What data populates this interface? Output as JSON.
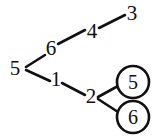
{
  "diagram": {
    "type": "tree-graph",
    "background_color": "#ffffff",
    "stroke_color": "#101010",
    "nodes": [
      {
        "id": "n5",
        "label": "5",
        "x": 15,
        "y": 68,
        "circled": false
      },
      {
        "id": "n6",
        "label": "6",
        "x": 51,
        "y": 48,
        "circled": false
      },
      {
        "id": "n4",
        "label": "4",
        "x": 92,
        "y": 31,
        "circled": false
      },
      {
        "id": "n3",
        "label": "3",
        "x": 132,
        "y": 13,
        "circled": false
      },
      {
        "id": "n1",
        "label": "1",
        "x": 56,
        "y": 79,
        "circled": false
      },
      {
        "id": "n2",
        "label": "2",
        "x": 91,
        "y": 96,
        "circled": false
      },
      {
        "id": "c5",
        "label": "5",
        "x": 133,
        "y": 82,
        "circled": true,
        "radius": 16
      },
      {
        "id": "c6",
        "label": "6",
        "x": 133,
        "y": 117,
        "circled": true,
        "radius": 16
      }
    ],
    "edges": [
      {
        "id": "e-5-6",
        "from": "vertex5",
        "to": "label6",
        "x1": 26,
        "y1": 67,
        "x2": 45,
        "y2": 55
      },
      {
        "id": "e-6-4",
        "from": "label6",
        "to": "label4",
        "x1": 58,
        "y1": 44,
        "x2": 85,
        "y2": 30
      },
      {
        "id": "e-4-3",
        "from": "label4",
        "to": "label3",
        "x1": 99,
        "y1": 28,
        "x2": 125,
        "y2": 15
      },
      {
        "id": "e-5-1",
        "from": "vertex5",
        "to": "label1",
        "x1": 26,
        "y1": 70,
        "x2": 50,
        "y2": 81
      },
      {
        "id": "e-1-2",
        "from": "label1",
        "to": "label2",
        "x1": 62,
        "y1": 83,
        "x2": 85,
        "y2": 95
      },
      {
        "id": "e-2-c5",
        "from": "vertex2",
        "to": "circle5",
        "x1": 98,
        "y1": 97,
        "x2": 118,
        "y2": 86
      },
      {
        "id": "e-2-c6",
        "from": "vertex2",
        "to": "circle6",
        "x1": 98,
        "y1": 99,
        "x2": 118,
        "y2": 112
      }
    ]
  }
}
